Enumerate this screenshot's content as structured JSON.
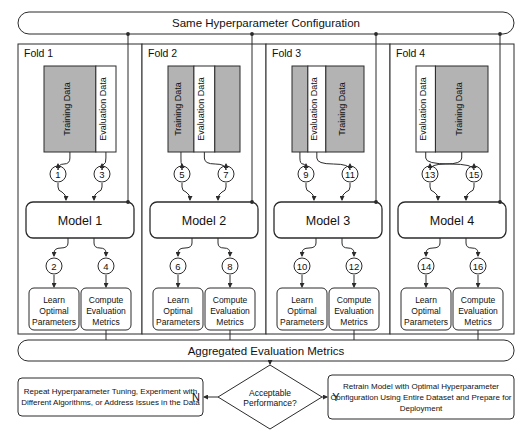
{
  "diagram": {
    "top_bar": {
      "label": "Same Hyperparameter Configuration"
    },
    "aggregate_bar": {
      "label": "Aggregated Evaluation Metrics"
    },
    "colors": {
      "training_fill": "#b3b3b3",
      "evaluation_fill": "#ffffff",
      "stroke": "#2b2b2b",
      "background": "#ffffff"
    },
    "data_block_labels": {
      "training": "Training Data",
      "evaluation": "Evaluation Data"
    },
    "step_labels": {
      "learn": "Learn\nOptimal\nParameters",
      "compute": "Compute\nEvaluation\nMetrics",
      "learn_lines": [
        "Learn",
        "Optimal",
        "Parameters"
      ],
      "compute_lines": [
        "Compute",
        "Evaluation",
        "Metrics"
      ]
    },
    "folds": [
      {
        "label": "Fold 1",
        "model_label": "Model 1",
        "segments": [
          {
            "kind": "training",
            "label": "Training Data",
            "width_pct": 72
          },
          {
            "kind": "evaluation",
            "label": "Evaluation Data",
            "width_pct": 28
          }
        ],
        "markers": {
          "train_in": "1",
          "eval_in": "3",
          "learn_out": "2",
          "compute_out": "4"
        },
        "learn_lines": [
          "Learn",
          "Optimal",
          "Parameters"
        ],
        "compute_lines": [
          "Compute",
          "Evaluation",
          "Metrics"
        ]
      },
      {
        "label": "Fold 2",
        "model_label": "Model 2",
        "segments": [
          {
            "kind": "training",
            "label": "Training Data",
            "width_pct": 36
          },
          {
            "kind": "evaluation",
            "label": "Evaluation Data",
            "width_pct": 29
          },
          {
            "kind": "training",
            "label": "",
            "width_pct": 35
          }
        ],
        "markers": {
          "train_in": "5",
          "eval_in": "7",
          "learn_out": "6",
          "compute_out": "8"
        },
        "learn_lines": [
          "Learn",
          "Optimal",
          "Parameters"
        ],
        "compute_lines": [
          "Compute",
          "Evaluation",
          "Metrics"
        ]
      },
      {
        "label": "Fold 3",
        "model_label": "Model 3",
        "segments": [
          {
            "kind": "training",
            "label": "",
            "width_pct": 22
          },
          {
            "kind": "evaluation",
            "label": "Evaluation Data",
            "width_pct": 25
          },
          {
            "kind": "training",
            "label": "Training Data",
            "width_pct": 53
          }
        ],
        "markers": {
          "train_in": "9",
          "eval_in": "11",
          "learn_out": "10",
          "compute_out": "12"
        },
        "learn_lines": [
          "Learn",
          "Optimal",
          "Parameters"
        ],
        "compute_lines": [
          "Compute",
          "Evaluation",
          "Metrics"
        ]
      },
      {
        "label": "Fold 4",
        "model_label": "Model 4",
        "segments": [
          {
            "kind": "evaluation",
            "label": "Evaluation Data",
            "width_pct": 27
          },
          {
            "kind": "training",
            "label": "Training Data",
            "width_pct": 73
          }
        ],
        "markers": {
          "train_in": "13",
          "eval_in": "15",
          "learn_out": "14",
          "compute_out": "16"
        },
        "learn_lines": [
          "Learn",
          "Optimal",
          "Parameters"
        ],
        "compute_lines": [
          "Compute",
          "Evaluation",
          "Metrics"
        ]
      }
    ],
    "decision": {
      "line1": "Acceptable",
      "line2": "Performance?",
      "no_label": "N",
      "yes_label": "Y"
    },
    "no_branch": {
      "line1": "Repeat Hyperparameter Tuning, Experiment with",
      "line2": "Different Algorithms, or Address Issues in the Data"
    },
    "yes_branch": {
      "line1": "Retrain Model with Optimal Hyperparameter",
      "line2": "Configuration Using Entire Dataset and Prepare for",
      "line3": "Deployment"
    }
  }
}
